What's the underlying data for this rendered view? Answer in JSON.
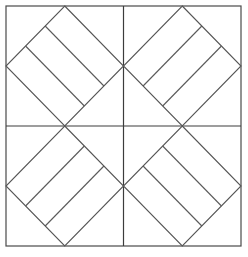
{
  "figure": {
    "background_color": "#ffffff",
    "line_color": "#4a4a4a",
    "width": 248,
    "height": 257
  },
  "chart_data": {
    "type": "diagram",
    "subtitle": "",
    "xlabel": "",
    "ylabel": "",
    "grid": false,
    "legend": "none",
    "frame": {
      "label": "outer-square",
      "x0": 6,
      "y0": 6,
      "x1": 241,
      "y1": 246,
      "stroke": "#4a4a4a",
      "stroke_width": 1.2
    },
    "center": {
      "x": 123.5,
      "y": 126.0
    },
    "axes": [
      {
        "label": "vertical-median",
        "x1": 123.5,
        "y1": 6,
        "x2": 123.5,
        "y2": 246
      },
      {
        "label": "horizontal-median",
        "x1": 6,
        "y1": 126,
        "x2": 241,
        "y2": 126
      }
    ],
    "quadrants": [
      {
        "name": "top-left",
        "bounds": [
          6,
          6,
          123.5,
          126
        ],
        "diamond_vertices": [
          [
            64.75,
            6
          ],
          [
            123.5,
            66
          ],
          [
            64.75,
            126
          ],
          [
            6,
            66
          ]
        ],
        "stripe_count": 2,
        "band_count": 3,
        "stripe_direction": "NE-SW",
        "stripe_fractions": [
          0.3333,
          0.6667
        ]
      },
      {
        "name": "top-right",
        "bounds": [
          123.5,
          6,
          241,
          126
        ],
        "diamond_vertices": [
          [
            182.25,
            6
          ],
          [
            241,
            66
          ],
          [
            182.25,
            126
          ],
          [
            123.5,
            66
          ]
        ],
        "stripe_count": 2,
        "band_count": 3,
        "stripe_direction": "NW-SE",
        "stripe_fractions": [
          0.3333,
          0.6667
        ]
      },
      {
        "name": "bottom-left",
        "bounds": [
          6,
          126,
          123.5,
          246
        ],
        "diamond_vertices": [
          [
            64.75,
            126
          ],
          [
            123.5,
            186
          ],
          [
            64.75,
            246
          ],
          [
            6,
            186
          ]
        ],
        "stripe_count": 2,
        "band_count": 3,
        "stripe_direction": "NW-SE",
        "stripe_fractions": [
          0.3333,
          0.6667
        ]
      },
      {
        "name": "bottom-right",
        "bounds": [
          123.5,
          126,
          241,
          246
        ],
        "diamond_vertices": [
          [
            182.25,
            126
          ],
          [
            241,
            186
          ],
          [
            182.25,
            246
          ],
          [
            123.5,
            186
          ]
        ],
        "stripe_count": 2,
        "band_count": 3,
        "stripe_direction": "NE-SW",
        "stripe_fractions": [
          0.3333,
          0.6667
        ]
      }
    ]
  }
}
